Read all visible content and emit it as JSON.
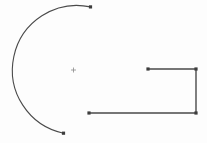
{
  "canvas": {
    "width": 207,
    "height": 143,
    "background_color": "#fdfdfd",
    "stroke_color": "#4a4a4a",
    "marker_color": "#3d3d3d",
    "center_mark_color": "#8a8a8a"
  },
  "shapes": {
    "arc": {
      "label": "open-arc",
      "center_x": 73.5,
      "center_y": 70.0,
      "radius": 62.0,
      "start_angle_deg": 165,
      "end_angle_deg": 75,
      "sweep_deg": 270,
      "stroke_width": 1.1,
      "path": "M 90.5 6.9 A 62 62 0 1 0 63.5 133.2",
      "endpoints": [
        {
          "label": "arc-endpoint-top",
          "x": 90.5,
          "y": 6.9
        },
        {
          "label": "arc-endpoint-bottom",
          "x": 63.5,
          "y": 133.2
        }
      ]
    },
    "center_mark": {
      "label": "arc-center-mark",
      "x": 73.5,
      "y": 70.0,
      "size": 5
    },
    "polyline": {
      "label": "open-bracket-polyline",
      "stroke_width": 1.4,
      "points": "148,69 196,69 196,113 89,113",
      "vertices": [
        {
          "label": "vertex-top-left",
          "x": 148,
          "y": 69
        },
        {
          "label": "vertex-top-right",
          "x": 196,
          "y": 69
        },
        {
          "label": "vertex-bottom-right",
          "x": 196,
          "y": 113
        },
        {
          "label": "vertex-bottom-left",
          "x": 89,
          "y": 113
        }
      ],
      "marker_size": 3.2
    }
  }
}
